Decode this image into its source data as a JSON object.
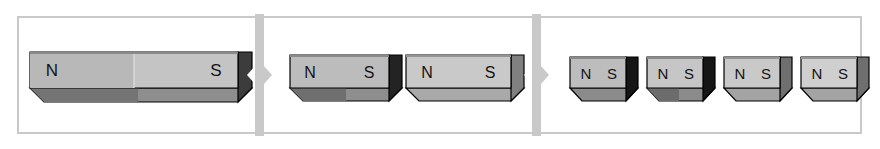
{
  "figure": {
    "width": 880,
    "height": 149,
    "background": "#ffffff"
  },
  "colors": {
    "frame_border": "#c9c9c9",
    "separator": "#c9c9c9",
    "magnet_outline": "#000000",
    "face_top": "#d8d8d8",
    "face_front_light": "#c0c0c0",
    "face_front_mid": "#b3b3b3",
    "face_front_dark": "#9a9a9a",
    "face_end_dark": "#1c1c1c",
    "face_end_mid": "#7b7b7b",
    "face_bottom_dark": "#6e6e6e",
    "face_bottom_mid": "#8e8e8e",
    "label_text": "#141414",
    "divider_line": "#ffffff"
  },
  "panels": [
    {
      "name": "panel-one-magnet",
      "index": 1,
      "magnet_count": 1,
      "magnets": [
        {
          "name": "magnet-whole",
          "north_label": "N",
          "south_label": "S",
          "end_face": "dark",
          "size": "large"
        }
      ]
    },
    {
      "name": "panel-two-magnets",
      "index": 2,
      "magnet_count": 2,
      "magnets": [
        {
          "name": "magnet-half-left",
          "north_label": "N",
          "south_label": "S",
          "end_face": "dark",
          "size": "medium"
        },
        {
          "name": "magnet-half-right",
          "north_label": "N",
          "south_label": "S",
          "end_face": "mid",
          "size": "medium"
        }
      ]
    },
    {
      "name": "panel-four-magnets",
      "index": 3,
      "magnet_count": 4,
      "magnets": [
        {
          "name": "magnet-quarter-1",
          "north_label": "N",
          "south_label": "S",
          "end_face": "dark",
          "size": "small"
        },
        {
          "name": "magnet-quarter-2",
          "north_label": "N",
          "south_label": "S",
          "end_face": "dark",
          "size": "small"
        },
        {
          "name": "magnet-quarter-3",
          "north_label": "N",
          "south_label": "S",
          "end_face": "mid",
          "size": "small"
        },
        {
          "name": "magnet-quarter-4",
          "north_label": "N",
          "south_label": "S",
          "end_face": "mid",
          "size": "small"
        }
      ]
    }
  ],
  "arrows": [
    {
      "name": "arrow-panel1-to-panel2",
      "direction": "right"
    },
    {
      "name": "arrow-panel2-to-panel3",
      "direction": "right"
    }
  ]
}
